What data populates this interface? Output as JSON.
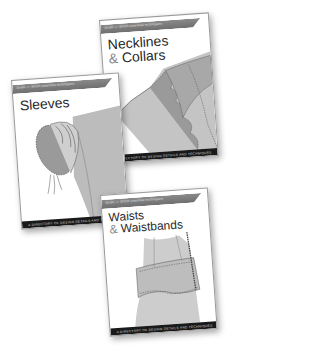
{
  "books": [
    {
      "id": "necklines",
      "series_band": "Seam — Stitch  essential techniques",
      "title_line1": "Necklines",
      "title_amp": "&",
      "title_line2": "Collars",
      "footer": "A DIRECTORY OF DESIGN DETAILS AND TECHNIQUES"
    },
    {
      "id": "sleeves",
      "series_band": "Seam — Stitch  essential techniques",
      "title_line1": "Sleeves",
      "footer": "A DIRECTORY OF DESIGN DETAILS AND TECHNIQUES"
    },
    {
      "id": "waists",
      "series_band": "Seam — Stitch  essential techniques",
      "title_line1": "Waists",
      "title_amp": "&",
      "title_line2": "Waistbands",
      "footer": "A DIRECTORY OF DESIGN DETAILS AND TECHNIQUES"
    }
  ],
  "colors": {
    "band": "#7a7a7a",
    "footer": "#1a1a1a",
    "title": "#2a2a2a",
    "fabric": "#b5b5b5"
  }
}
